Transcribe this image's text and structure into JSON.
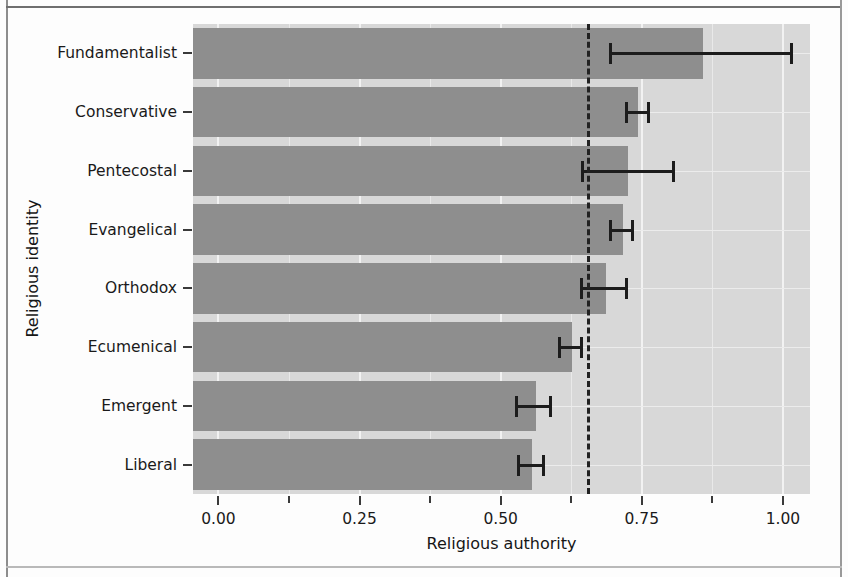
{
  "figure": {
    "background_color": "#fdfdfd",
    "panel_color": "#d8d8d8",
    "bar_color": "#8e8e8e",
    "errorbar_color": "#1c1c1c",
    "refline_color": "#222222"
  },
  "axes": {
    "x_title": "Religious authority",
    "y_title": "Religious identity",
    "x_ticks": [
      "0.00",
      "0.25",
      "0.50",
      "0.75",
      "1.00"
    ],
    "x_tick_values": [
      0.0,
      0.25,
      0.5,
      0.75,
      1.0
    ],
    "x_minor_tick_values": [
      0.125,
      0.375,
      0.625,
      0.875
    ],
    "x_min": -0.045,
    "x_max": 1.048
  },
  "chart_data": {
    "type": "bar",
    "orientation": "horizontal",
    "title": "",
    "subtitle": "",
    "xlabel": "Religious authority",
    "ylabel": "Religious identity",
    "xlim": [
      -0.045,
      1.048
    ],
    "grid": true,
    "legend": null,
    "categories": [
      "Fundamentalist",
      "Conservative",
      "Pentecostal",
      "Evangelical",
      "Orthodox",
      "Ecumenical",
      "Emergent",
      "Liberal"
    ],
    "values": [
      0.858,
      0.743,
      0.726,
      0.717,
      0.687,
      0.627,
      0.563,
      0.556
    ],
    "error_low": [
      0.692,
      0.72,
      0.643,
      0.692,
      0.641,
      0.602,
      0.526,
      0.529
    ],
    "error_high": [
      1.018,
      0.765,
      0.809,
      0.736,
      0.726,
      0.646,
      0.591,
      0.579
    ],
    "reference_line": {
      "value": 0.655,
      "style": "dashed",
      "orientation": "vertical"
    },
    "annotations": []
  }
}
